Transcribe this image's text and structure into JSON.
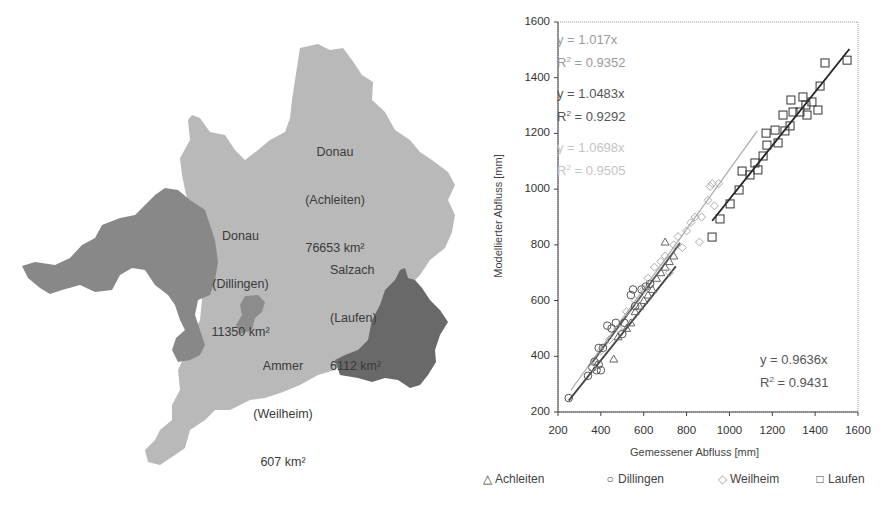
{
  "map": {
    "regions": [
      {
        "id": "achleiten",
        "name": "Donau",
        "gauge": "(Achleiten)",
        "area": "76653 km²",
        "color": "#b9b9b9"
      },
      {
        "id": "dillingen",
        "name": "Donau",
        "gauge": "(Dillingen)",
        "area": "11350 km²",
        "color": "#888888"
      },
      {
        "id": "laufen",
        "name": "Salzach",
        "gauge": "(Laufen)",
        "area": "6112 km²",
        "color": "#696969"
      },
      {
        "id": "weilheim",
        "name": "Ammer",
        "gauge": "(Weilheim)",
        "area": "607 km²",
        "color": "#8c8c8c"
      }
    ]
  },
  "chart_data": {
    "type": "scatter",
    "title": "",
    "xlabel": "Gemessener Abfluss [mm]",
    "ylabel": "Modellierter Abfluss [mm]",
    "xlim": [
      200,
      1600
    ],
    "ylim": [
      200,
      1600
    ],
    "xticks": [
      200,
      400,
      600,
      800,
      1000,
      1200,
      1400,
      1600
    ],
    "yticks": [
      200,
      400,
      600,
      800,
      1000,
      1200,
      1400,
      1600
    ],
    "grid": false,
    "legend_position": "bottom",
    "series": [
      {
        "name": "Achleiten",
        "marker": "triangle",
        "color": "#666666",
        "trendline": {
          "equation": "y = 1.0483x",
          "r2": "R2 = 0.9292",
          "slope": 1.0483,
          "r2_value": 0.9292,
          "x_range": [
            360,
            770
          ]
        },
        "points": [
          [
            460,
            390
          ],
          [
            480,
            470
          ],
          [
            520,
            500
          ],
          [
            540,
            520
          ],
          [
            560,
            560
          ],
          [
            580,
            580
          ],
          [
            600,
            600
          ],
          [
            620,
            620
          ],
          [
            640,
            640
          ],
          [
            660,
            680
          ],
          [
            680,
            700
          ],
          [
            700,
            720
          ],
          [
            720,
            740
          ],
          [
            740,
            760
          ],
          [
            700,
            810
          ]
        ]
      },
      {
        "name": "Dillingen",
        "marker": "circle",
        "color": "#555555",
        "trendline": {
          "equation": "y = 0.9636x",
          "r2": "R2 = 0.9431",
          "slope": 0.9636,
          "r2_value": 0.9431,
          "x_range": [
            250,
            750
          ]
        },
        "points": [
          [
            250,
            250
          ],
          [
            340,
            330
          ],
          [
            360,
            360
          ],
          [
            370,
            380
          ],
          [
            380,
            350
          ],
          [
            390,
            370
          ],
          [
            400,
            350
          ],
          [
            390,
            430
          ],
          [
            410,
            430
          ],
          [
            430,
            510
          ],
          [
            450,
            500
          ],
          [
            470,
            520
          ],
          [
            500,
            480
          ],
          [
            510,
            520
          ],
          [
            540,
            620
          ],
          [
            550,
            640
          ],
          [
            560,
            580
          ],
          [
            590,
            640
          ],
          [
            610,
            650
          ],
          [
            630,
            660
          ]
        ]
      },
      {
        "name": "Weilheim",
        "marker": "diamond",
        "color": "#aaaaaa",
        "trendline": {
          "equation": "y = 1.0698x",
          "r2": "R2 = 0.9505",
          "slope": 1.0698,
          "r2_value": 0.9505,
          "x_range": [
            260,
            1130
          ]
        },
        "points": [
          [
            360,
            360
          ],
          [
            400,
            420
          ],
          [
            440,
            460
          ],
          [
            480,
            500
          ],
          [
            520,
            560
          ],
          [
            560,
            600
          ],
          [
            600,
            640
          ],
          [
            620,
            680
          ],
          [
            650,
            720
          ],
          [
            680,
            740
          ],
          [
            700,
            760
          ],
          [
            740,
            800
          ],
          [
            760,
            830
          ],
          [
            800,
            850
          ],
          [
            820,
            880
          ],
          [
            840,
            900
          ],
          [
            870,
            900
          ],
          [
            900,
            960
          ],
          [
            910,
            1010
          ],
          [
            920,
            1020
          ],
          [
            950,
            1020
          ],
          [
            930,
            940
          ],
          [
            860,
            810
          ],
          [
            780,
            790
          ],
          [
            720,
            700
          ]
        ]
      },
      {
        "name": "Laufen",
        "marker": "square",
        "color": "#333333",
        "trendline": {
          "equation": "y = 0.9636x",
          "r2": "R2 = 0.9431",
          "slope": 0.9636,
          "r2_value": 0.9431,
          "x_range": [
            920,
            1560
          ]
        },
        "points": [
          [
            919,
            828
          ],
          [
            956,
            893
          ],
          [
            1003,
            947
          ],
          [
            1045,
            997
          ],
          [
            1059,
            1065
          ],
          [
            1096,
            1051
          ],
          [
            1119,
            1094
          ],
          [
            1133,
            1069
          ],
          [
            1157,
            1119
          ],
          [
            1175,
            1158
          ],
          [
            1171,
            1201
          ],
          [
            1213,
            1212
          ],
          [
            1227,
            1166
          ],
          [
            1250,
            1266
          ],
          [
            1259,
            1209
          ],
          [
            1283,
            1227
          ],
          [
            1287,
            1320
          ],
          [
            1297,
            1277
          ],
          [
            1329,
            1277
          ],
          [
            1343,
            1331
          ],
          [
            1357,
            1302
          ],
          [
            1362,
            1266
          ],
          [
            1385,
            1313
          ],
          [
            1413,
            1284
          ],
          [
            1423,
            1370
          ],
          [
            1446,
            1453
          ],
          [
            1549,
            1463
          ]
        ]
      }
    ],
    "annotations": [
      {
        "text": "y = 1.017x",
        "r2": "R2 = 0.9352",
        "color": "#9a9a9a",
        "position": "top-left"
      },
      {
        "text": "y = 1.0483x",
        "r2": "R2 = 0.9292",
        "color": "#555555",
        "position": "top-left"
      },
      {
        "text": "y = 1.0698x",
        "r2": "R2 = 0.9505",
        "color": "#c4c4c4",
        "position": "top-left"
      },
      {
        "text": "y = 0.9636x",
        "r2": "R2 = 0.9431",
        "color": "#555555",
        "position": "bottom-right"
      }
    ]
  },
  "equations": {
    "eq1": {
      "line": "y = 1.017x",
      "r2_prefix": "R",
      "r2_suffix": " = 0.9352"
    },
    "eq2": {
      "line": "y = 1.0483x",
      "r2_prefix": "R",
      "r2_suffix": " = 0.9292"
    },
    "eq3": {
      "line": "y = 1.0698x",
      "r2_prefix": "R",
      "r2_suffix": " = 0.9505"
    },
    "eq4": {
      "line": "y = 0.9636x",
      "r2_prefix": "R",
      "r2_suffix": " = 0.9431"
    },
    "sup": "2"
  },
  "legend": {
    "achleiten": {
      "symbol": "△",
      "label": "Achleiten"
    },
    "dillingen": {
      "symbol": "○",
      "label": "Dillingen"
    },
    "weilheim": {
      "symbol": "◇",
      "label": "Weilheim"
    },
    "laufen": {
      "symbol": "□",
      "label": "Laufen"
    }
  }
}
